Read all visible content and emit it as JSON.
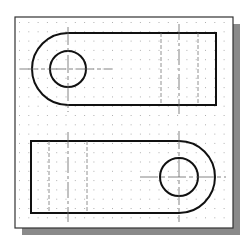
{
  "colors": {
    "background": "#ffffff",
    "paper": "#ffffff",
    "frame": "#333333",
    "shadow": "#8a8a8a",
    "grid_dot": "#b0b0b0",
    "object_line": "#111111",
    "hidden_line": "#777777",
    "center_line": "#666666"
  },
  "frame": {
    "x": 15,
    "y": 17,
    "width": 218,
    "height": 211,
    "shadow_offset": 7
  },
  "grid": {
    "spacing": 9.3,
    "origin_x": 19,
    "origin_y": 22
  },
  "views": {
    "top": {
      "label": "top-view",
      "rect_left": 68,
      "rect_right": 216,
      "top": 33,
      "bottom": 105,
      "arc_center": [
        68,
        69
      ],
      "outer_radius": 36,
      "hole_radius": 18,
      "hidden_lines_x": [
        161,
        198
      ],
      "center_line_x": 179,
      "center_line_y_range": [
        24,
        114
      ],
      "hole_center_h_range": [
        20,
        112
      ],
      "hole_center_v_range": [
        27,
        112
      ]
    },
    "bottom": {
      "label": "bottom-view",
      "rect_left": 31,
      "rect_right": 179,
      "top": 141,
      "bottom": 213,
      "arc_center": [
        179,
        177
      ],
      "outer_radius": 36,
      "hole_radius": 19,
      "hidden_lines_x": [
        49,
        87
      ],
      "center_line_x": 68,
      "center_line_y_range": [
        132,
        222
      ],
      "hole_center_h_range": [
        140,
        226
      ],
      "hole_center_v_range": [
        131,
        222
      ]
    }
  }
}
